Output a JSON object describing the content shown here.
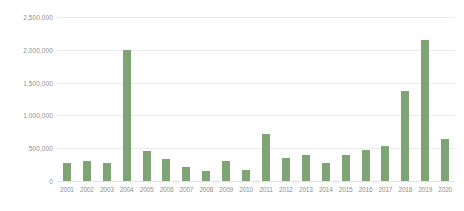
{
  "chart_data": {
    "type": "bar",
    "title": "",
    "xlabel": "",
    "ylabel": "",
    "categories": [
      "2001",
      "2002",
      "2003",
      "2004",
      "2005",
      "2006",
      "2007",
      "2008",
      "2009",
      "2010",
      "2011",
      "2012",
      "2013",
      "2014",
      "2015",
      "2016",
      "2017",
      "2018",
      "2019",
      "2020"
    ],
    "values": [
      270000,
      305000,
      275000,
      2000000,
      455000,
      330000,
      215000,
      150000,
      300000,
      175000,
      715000,
      345000,
      390000,
      270000,
      400000,
      470000,
      540000,
      1370000,
      2155000,
      635000
    ],
    "series": [
      {
        "name": "",
        "values": [
          270000,
          305000,
          275000,
          2000000,
          455000,
          330000,
          215000,
          150000,
          300000,
          175000,
          715000,
          345000,
          390000,
          270000,
          400000,
          470000,
          540000,
          1370000,
          2155000,
          635000
        ]
      }
    ],
    "ylim": [
      0,
      2500000
    ],
    "y_ticks": [
      0,
      500000,
      1000000,
      1500000,
      2000000,
      2500000
    ],
    "y_tick_labels": [
      "0",
      "500,000",
      "1,000,000",
      "1,500,000",
      "2,000,000",
      "2,500,000"
    ],
    "grid": true,
    "legend": false,
    "bar_color": "#7fa576",
    "gridline_color": "#ebebeb",
    "tick_label_color": "#8f8f8f",
    "background_color": "#ffffff"
  }
}
